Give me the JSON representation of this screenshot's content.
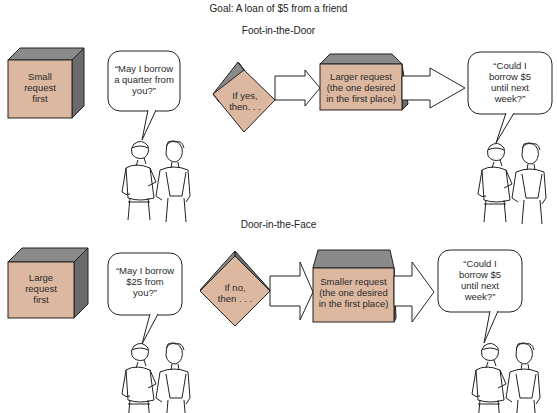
{
  "goal": "Goal:  A loan of $5 from a friend",
  "colors": {
    "front": "#dcb8a0",
    "top": "#808080",
    "side": "#6a6a6a",
    "outline": "#222222"
  },
  "sections": [
    {
      "title": "Foot-in-the-Door",
      "first_box": [
        "Small",
        "request",
        "first"
      ],
      "first_speech": [
        "“May I borrow",
        "a quarter from",
        "you?”"
      ],
      "decision": [
        "If yes,",
        "then. . ."
      ],
      "second_box": [
        "Larger request",
        "(the one desired",
        "in the first place)"
      ],
      "second_speech": [
        "“Could I",
        "borrow $5",
        "until next",
        "week?”"
      ]
    },
    {
      "title": "Door-in-the-Face",
      "first_box": [
        "Large",
        "request",
        "first"
      ],
      "first_speech": [
        "“May I borrow",
        "$25 from",
        "you?”"
      ],
      "decision": [
        "If no,",
        "then . . ."
      ],
      "second_box": [
        "Smaller request",
        "(the one desired",
        "in the first place)"
      ],
      "second_speech": [
        "“Could I",
        "borrow $5",
        "until next",
        "week?”"
      ]
    }
  ]
}
